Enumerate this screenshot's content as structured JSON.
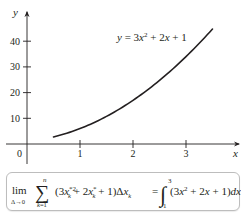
{
  "chart_data": {
    "type": "line",
    "title": "",
    "xlabel": "x",
    "ylabel": "y",
    "xlim": [
      0,
      3.7
    ],
    "ylim": [
      0,
      48
    ],
    "xticks": [
      1,
      2,
      3
    ],
    "yticks": [
      10,
      20,
      30,
      40
    ],
    "origin_label": "0",
    "grid": false,
    "series": [
      {
        "name": "y = 3x^2 + 2x + 1",
        "function": "3x^2 + 2x + 1",
        "x": [
          0.5,
          0.75,
          1.0,
          1.25,
          1.5,
          1.75,
          2.0,
          2.25,
          2.5,
          2.75,
          3.0,
          3.25,
          3.5
        ],
        "y": [
          2.75,
          4.19,
          6.0,
          8.19,
          10.75,
          13.69,
          17.0,
          20.69,
          24.75,
          29.19,
          34.0,
          39.19,
          44.75
        ]
      }
    ],
    "annotations": [
      {
        "text": "y = 3x² + 2x + 1",
        "position": "upper-right near curve"
      }
    ]
  },
  "labels": {
    "y_axis": "y",
    "x_axis": "x",
    "origin": "0",
    "x_ticks": [
      "1",
      "2",
      "3"
    ],
    "y_ticks": [
      "10",
      "20",
      "30",
      "40"
    ],
    "curve_equation": "y = 3x² + 2x + 1"
  },
  "formula": {
    "lim": "lim",
    "lim_sub": "Δ→0",
    "sigma": "∑",
    "sum_upper": "n",
    "sum_lower": "k=1",
    "summand": "(3x*k² + 2x*k + 1)Δxk",
    "equals": "=",
    "integral_upper": "3",
    "integral_lower": "1",
    "integrand": "(3x² + 2x + 1)dx"
  },
  "colors": {
    "ink": "#231f20",
    "box_border": "#bdbdbd",
    "background": "#ffffff"
  }
}
